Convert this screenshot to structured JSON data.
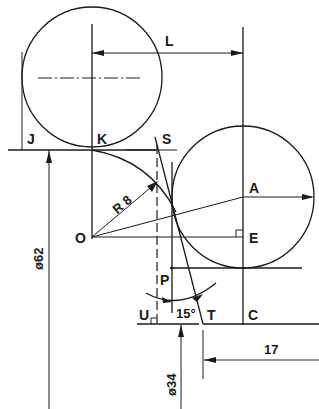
{
  "figure": {
    "type": "engineering-construction-drawing",
    "background": "#ffffff",
    "ink": "#1a1a1a"
  },
  "points": {
    "J": "J",
    "K": "K",
    "S": "S",
    "A": "A",
    "O": "O",
    "E": "E",
    "P": "P",
    "U": "U",
    "T": "T",
    "C": "C"
  },
  "dimensions": {
    "length": "L",
    "radius": "R 8",
    "diameter_large": "ø62",
    "diameter_small": "ø34",
    "angle": "15°",
    "offset": "17"
  }
}
